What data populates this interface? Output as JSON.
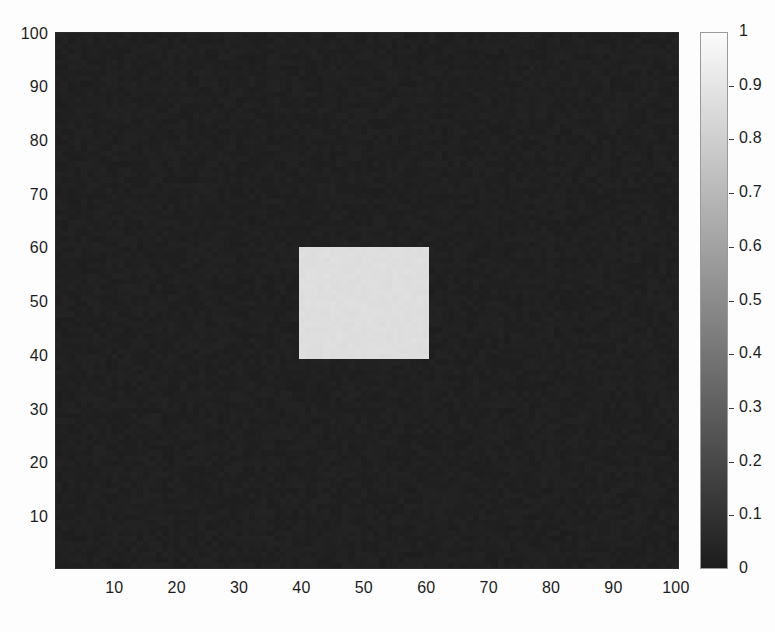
{
  "chart_data": {
    "type": "heatmap",
    "title": "",
    "xlabel": "",
    "ylabel": "",
    "xlim": [
      0.5,
      100.5
    ],
    "ylim": [
      0.5,
      100.5
    ],
    "grid": false,
    "colormap": "gray",
    "colorbar": {
      "position": "right",
      "orientation": "vertical",
      "vmin": 0,
      "vmax": 1,
      "low_color": "#1c1c1c",
      "high_color": "#fbfbfb",
      "ticks": [
        {
          "value": 1,
          "label": "1"
        },
        {
          "value": 0.9,
          "label": "0.9"
        },
        {
          "value": 0.8,
          "label": "0.8"
        },
        {
          "value": 0.7,
          "label": "0.7"
        },
        {
          "value": 0.6,
          "label": "0.6"
        },
        {
          "value": 0.5,
          "label": "0.5"
        },
        {
          "value": 0.4,
          "label": "0.4"
        },
        {
          "value": 0.3,
          "label": "0.3"
        },
        {
          "value": 0.2,
          "label": "0.2"
        },
        {
          "value": 0.1,
          "label": "0.1"
        },
        {
          "value": 0,
          "label": "0"
        }
      ]
    },
    "xticks": [
      {
        "value": 10,
        "label": "10"
      },
      {
        "value": 20,
        "label": "20"
      },
      {
        "value": 30,
        "label": "30"
      },
      {
        "value": 40,
        "label": "40"
      },
      {
        "value": 50,
        "label": "50"
      },
      {
        "value": 60,
        "label": "60"
      },
      {
        "value": 70,
        "label": "70"
      },
      {
        "value": 80,
        "label": "80"
      },
      {
        "value": 90,
        "label": "90"
      },
      {
        "value": 100,
        "label": "100"
      }
    ],
    "yticks": [
      {
        "value": 10,
        "label": "10"
      },
      {
        "value": 20,
        "label": "20"
      },
      {
        "value": 30,
        "label": "30"
      },
      {
        "value": 40,
        "label": "40"
      },
      {
        "value": 50,
        "label": "50"
      },
      {
        "value": 60,
        "label": "60"
      },
      {
        "value": 70,
        "label": "70"
      },
      {
        "value": 80,
        "label": "80"
      },
      {
        "value": 90,
        "label": "90"
      },
      {
        "value": 100,
        "label": "100"
      }
    ],
    "y_axis_direction": "up",
    "grid_size": {
      "rows": 100,
      "cols": 100
    },
    "background_value": 0.02,
    "background_noise_amplitude": 0.025,
    "regions": [
      {
        "name": "bright-square",
        "shape": "rectangle",
        "x_range": [
          40,
          60
        ],
        "y_range": [
          40,
          60
        ],
        "value": 0.87
      }
    ]
  }
}
